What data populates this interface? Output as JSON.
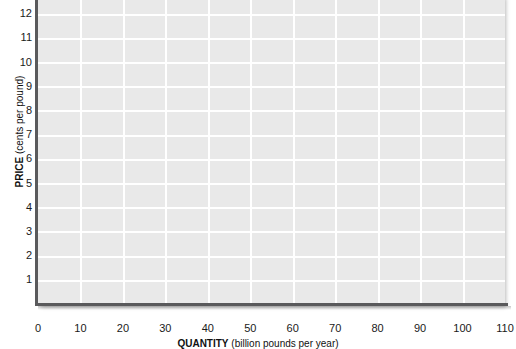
{
  "chart_data": {
    "type": "line",
    "title": "",
    "subtitle": "",
    "xlabel_bold": "QUANTITY",
    "xlabel_rest": "(billion pounds per year)",
    "ylabel_bold": "PRICE",
    "ylabel_rest": "(cents per pound)",
    "xlabel": "QUANTITY (billion pounds per year)",
    "ylabel": "PRICE (cents per pound)",
    "xlim": [
      0,
      110
    ],
    "ylim": [
      0,
      12.8
    ],
    "xticks": [
      0,
      10,
      20,
      30,
      40,
      50,
      60,
      70,
      80,
      90,
      100,
      110
    ],
    "xtick_labels": [
      "0",
      "10",
      "20",
      "30",
      "40",
      "50",
      "60",
      "70",
      "80",
      "90",
      "100",
      "110"
    ],
    "yticks": [
      1,
      2,
      3,
      4,
      5,
      6,
      7,
      8,
      9,
      10,
      11,
      12
    ],
    "ytick_labels": [
      "1",
      "2",
      "3",
      "4",
      "5",
      "6",
      "7",
      "8",
      "9",
      "10",
      "11",
      "12"
    ],
    "grid": true,
    "grid_color": "#ffffff",
    "plot_background": "#e9e9e9",
    "axis_color": "#5a5a5c",
    "legend": [],
    "series": [],
    "annotations": [],
    "note": "Empty graph grid with no plotted data series."
  },
  "colors": {
    "page_background": "#ffffff",
    "plot_background": "#e9e9e9",
    "gridline": "#ffffff",
    "axis": "#5a5a5c",
    "tick_text": "#1a1a1a",
    "title_text": "#111111"
  }
}
